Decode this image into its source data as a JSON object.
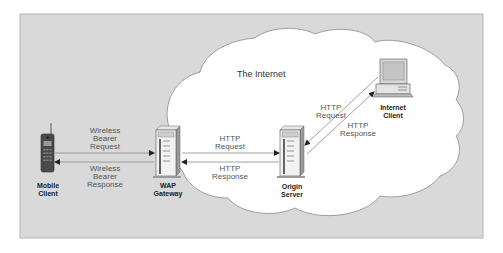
{
  "diagram": {
    "colors": {
      "panel_bg": "#d9d9d9",
      "panel_border": "#b5b5b5",
      "cloud_fill": "#ffffff",
      "cloud_stroke": "#8a8a8a",
      "arrow": "#8a8a8a"
    },
    "cloud_label": "The Internet",
    "nodes": {
      "mobile_client": {
        "line1": "Mobile",
        "line2": "Client",
        "icon": "mobile-phone-icon"
      },
      "wap_gateway": {
        "line1": "WAP",
        "line2": "Gateway",
        "icon": "server-tower-icon"
      },
      "origin_server": {
        "line1": "Origin",
        "line2": "Server",
        "icon": "server-tower-icon"
      },
      "internet_client": {
        "line1": "Internet",
        "line2": "Client",
        "icon": "desktop-computer-icon"
      }
    },
    "edges": {
      "wireless_request": {
        "line1": "Wireless",
        "line2": "Bearer",
        "line3": "Request",
        "from": "Mobile Client",
        "to": "WAP Gateway"
      },
      "wireless_response": {
        "line1": "Wireless",
        "line2": "Bearer",
        "line3": "Response",
        "from": "WAP Gateway",
        "to": "Mobile Client"
      },
      "gw_http_request": {
        "line1": "HTTP",
        "line2": "Request",
        "from": "WAP Gateway",
        "to": "Origin Server"
      },
      "gw_http_response": {
        "line1": "HTTP",
        "line2": "Response",
        "from": "Origin Server",
        "to": "WAP Gateway"
      },
      "ic_http_request": {
        "line1": "HTTP",
        "line2": "Request",
        "from": "Internet Client",
        "to": "Origin Server"
      },
      "ic_http_response": {
        "line1": "HTTP",
        "line2": "Response",
        "from": "Origin Server",
        "to": "Internet Client"
      }
    }
  }
}
